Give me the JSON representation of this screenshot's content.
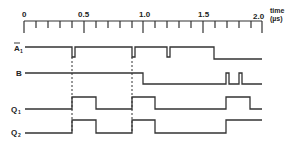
{
  "axis": {
    "title": "time",
    "unit": "(µs)",
    "tick_labels": [
      "0",
      "0.5",
      "1.0",
      "1.5",
      "2.0"
    ],
    "range": [
      0,
      2.0
    ],
    "minor_step": 0.1
  },
  "signals": [
    {
      "name": "A1",
      "label": "A",
      "subscript": "1",
      "overbar": true,
      "transitions": "high with short low pulses at ~0.4, ~0.92, ~1.22 µs; goes low at ~1.6 µs"
    },
    {
      "name": "B",
      "label": "B",
      "transitions": "high until ~1.0 µs, low after; short high pulses at ~1.70 and ~1.81 µs"
    },
    {
      "name": "Q1",
      "label": "Q",
      "subscript": "1",
      "transitions": "high 0.4–0.6, 0.92–1.1, 1.70–1.90 µs"
    },
    {
      "name": "Q2",
      "label": "Q",
      "subscript": "2",
      "transitions": "high 0.4–0.6, 0.92–1.1, from 1.70 µs onward"
    }
  ],
  "dashed_markers_us": [
    0.4,
    0.92
  ]
}
